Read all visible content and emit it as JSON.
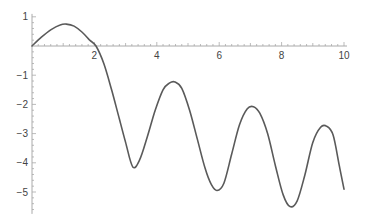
{
  "chart_data": {
    "type": "line",
    "title": "",
    "xlabel": "",
    "ylabel": "",
    "xlim": [
      0,
      10
    ],
    "ylim": [
      -5.7,
      1.1
    ],
    "grid": false,
    "x_ticks": [
      2,
      4,
      6,
      8,
      10
    ],
    "y_ticks": [
      1,
      -1,
      -2,
      -3,
      -4,
      -5
    ],
    "x_tick_labels": [
      "2",
      "4",
      "6",
      "8",
      "10"
    ],
    "y_tick_labels": [
      "1",
      "−1",
      "−2",
      "−3",
      "−4",
      "−5"
    ],
    "line_color": "#5a5a5a",
    "axis_color": "#aaaaaa",
    "series": [
      {
        "name": "f(x)",
        "x": [
          0,
          0.3,
          0.6,
          0.9,
          1.1,
          1.35,
          1.6,
          1.85,
          2.05,
          2.3,
          2.55,
          2.8,
          3.0,
          3.23,
          3.45,
          3.7,
          3.95,
          4.2,
          4.4,
          4.58,
          4.8,
          5.05,
          5.3,
          5.55,
          5.75,
          5.93,
          6.15,
          6.4,
          6.65,
          6.9,
          7.1,
          7.3,
          7.55,
          7.8,
          8.05,
          8.27,
          8.5,
          8.75,
          9.0,
          9.25,
          9.45,
          9.65,
          9.85,
          10.0
        ],
        "y": [
          0,
          0.3,
          0.55,
          0.72,
          0.75,
          0.68,
          0.48,
          0.2,
          0.0,
          -0.6,
          -1.5,
          -2.5,
          -3.3,
          -4.14,
          -3.9,
          -3.1,
          -2.2,
          -1.5,
          -1.27,
          -1.23,
          -1.45,
          -2.2,
          -3.2,
          -4.2,
          -4.75,
          -4.95,
          -4.7,
          -3.7,
          -2.7,
          -2.15,
          -2.08,
          -2.3,
          -3.0,
          -4.1,
          -5.1,
          -5.5,
          -5.3,
          -4.4,
          -3.3,
          -2.78,
          -2.75,
          -3.05,
          -4.1,
          -4.9
        ]
      }
    ]
  }
}
